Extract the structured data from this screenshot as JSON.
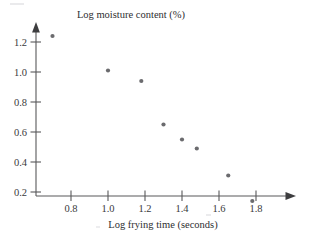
{
  "figure": {
    "background_color": "#ffffff",
    "axis_color": "#58585a",
    "marker_color": "#6b6b6e",
    "text_color": "#2e2e30"
  },
  "chart_data": {
    "type": "scatter",
    "title": "",
    "xlabel": "Log frying time (seconds)",
    "ylabel": "Log moisture content (%)",
    "xlim": [
      0.62,
      1.93
    ],
    "ylim": [
      0.02,
      1.32
    ],
    "xticks": [
      "0.8",
      "1.0",
      "1.2",
      "1.4",
      "1.6",
      "1.8"
    ],
    "xtick_values": [
      0.8,
      1.0,
      1.2,
      1.4,
      1.6,
      1.8
    ],
    "yticks": [
      "1.2",
      "1.0",
      "0.8",
      "0.6",
      "0.4",
      "0.2"
    ],
    "ytick_values": [
      1.2,
      1.0,
      0.8,
      0.6,
      0.4,
      0.2
    ],
    "grid": false,
    "legend": false,
    "x": [
      0.7,
      1.0,
      1.18,
      1.3,
      1.4,
      1.48,
      1.65,
      1.78
    ],
    "y": [
      1.24,
      1.01,
      0.94,
      0.65,
      0.55,
      0.49,
      0.31,
      0.14
    ],
    "points": [
      {
        "x": 0.7,
        "y": 1.24
      },
      {
        "x": 1.0,
        "y": 1.01
      },
      {
        "x": 1.18,
        "y": 0.94
      },
      {
        "x": 1.3,
        "y": 0.65
      },
      {
        "x": 1.4,
        "y": 0.55
      },
      {
        "x": 1.48,
        "y": 0.49
      },
      {
        "x": 1.65,
        "y": 0.31
      },
      {
        "x": 1.78,
        "y": 0.14
      }
    ],
    "marker": "filled-circle",
    "marker_size": 4,
    "axis_arrows": [
      "x-right",
      "y-up"
    ]
  }
}
